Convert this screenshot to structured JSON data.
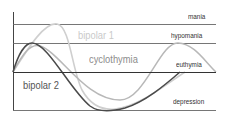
{
  "diagram": {
    "title": "",
    "states": [
      {
        "label": "mania",
        "y": 24
      },
      {
        "label": "hypomania",
        "y": 43
      },
      {
        "label": "euthymia",
        "y": 72
      },
      {
        "label": "depression",
        "y": 110
      }
    ],
    "curves": [
      {
        "name": "bipolar 1",
        "color": "#c8c8c8",
        "peak_state": "mania",
        "trough_state": "depression"
      },
      {
        "name": "cyclothymia",
        "color": "#b4b4b4",
        "peak_state": "hypomania",
        "trough_state": "mild depression"
      },
      {
        "name": "bipolar 2",
        "color": "#555555",
        "peak_state": "hypomania",
        "trough_state": "depression"
      }
    ],
    "labels": {
      "mania": "mania",
      "hypomania": "hypomania",
      "euthymia": "euthymia",
      "depression": "depression",
      "bipolar1": "bipolar 1",
      "cyclothymia": "cyclothymia",
      "bipolar2": "bipolar 2"
    },
    "colors": {
      "axis": "#444444",
      "gridline": "#666666",
      "baseline": "#333333",
      "bipolar1": "#cccccc",
      "cyclothymia": "#b0b0b0",
      "bipolar2": "#4a4a4a",
      "cyclothymia_text": "#8a8a8a",
      "bipolar1_text": "#c8c8c8",
      "bipolar2_text": "#555555"
    }
  }
}
